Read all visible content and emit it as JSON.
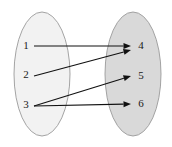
{
  "diagram": {
    "type": "mapping-diagram",
    "title": "",
    "canvas": {
      "width": 172,
      "height": 147,
      "background": "#ffffff"
    },
    "sets": [
      {
        "id": "domain",
        "name": "left-set",
        "fill": "#f2f2f2",
        "stroke": "#9a9a9a",
        "cx": 42,
        "cy": 74,
        "rx": 28,
        "ry": 62,
        "nodes": [
          {
            "id": "n1",
            "label": "1",
            "x": 26,
            "y": 46
          },
          {
            "id": "n2",
            "label": "2",
            "x": 26,
            "y": 75
          },
          {
            "id": "n3",
            "label": "3",
            "x": 26,
            "y": 105
          }
        ]
      },
      {
        "id": "codomain",
        "name": "right-set",
        "fill": "#d9d9d9",
        "stroke": "#9a9a9a",
        "cx": 133,
        "cy": 74,
        "rx": 28,
        "ry": 62,
        "nodes": [
          {
            "id": "n4",
            "label": "4",
            "x": 141,
            "y": 46
          },
          {
            "id": "n5",
            "label": "5",
            "x": 141,
            "y": 76
          },
          {
            "id": "n6",
            "label": "6",
            "x": 141,
            "y": 104
          }
        ]
      }
    ],
    "arrows": [
      {
        "id": "a1",
        "name": "arrow-1-to-4",
        "from": "1",
        "to": "4",
        "x1": 34,
        "y1": 46,
        "x2": 131,
        "y2": 46,
        "color": "#111111"
      },
      {
        "id": "a2",
        "name": "arrow-2-to-4",
        "from": "2",
        "to": "4",
        "x1": 34,
        "y1": 76,
        "x2": 131,
        "y2": 50,
        "color": "#111111"
      },
      {
        "id": "a3",
        "name": "arrow-3-to-5",
        "from": "3",
        "to": "5",
        "x1": 34,
        "y1": 106,
        "x2": 131,
        "y2": 76,
        "color": "#111111"
      },
      {
        "id": "a4",
        "name": "arrow-3-to-6",
        "from": "3",
        "to": "6",
        "x1": 34,
        "y1": 106,
        "x2": 131,
        "y2": 104,
        "color": "#111111"
      }
    ]
  }
}
